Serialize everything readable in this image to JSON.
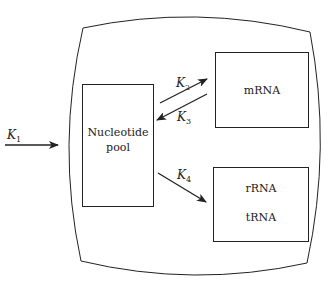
{
  "diagram": {
    "type": "compartment-flow",
    "compartment": {
      "name": "cell"
    },
    "boxes": {
      "pool": {
        "line1": "Nucleotide",
        "line2": "pool"
      },
      "mrna": {
        "label": "mRNA"
      },
      "stable": {
        "line1": "rRNA",
        "line2": "tRNA"
      }
    },
    "rates": {
      "k1": {
        "base": "K",
        "sub": "1"
      },
      "k2": {
        "base": "K",
        "sub": "2"
      },
      "k3": {
        "base": "K",
        "sub": "3"
      },
      "k4": {
        "base": "K",
        "sub": "4"
      }
    },
    "edges": [
      {
        "from": "outside",
        "to": "Nucleotide pool",
        "rate": "K1"
      },
      {
        "from": "Nucleotide pool",
        "to": "mRNA",
        "rate": "K2"
      },
      {
        "from": "mRNA",
        "to": "Nucleotide pool",
        "rate": "K3"
      },
      {
        "from": "Nucleotide pool",
        "to": "rRNA/tRNA",
        "rate": "K4"
      }
    ],
    "colors": {
      "stroke": "#222222",
      "background": "#ffffff"
    }
  }
}
